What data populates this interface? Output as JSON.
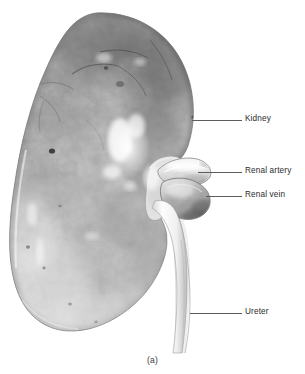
{
  "figure": {
    "caption": "(a)",
    "caption_x": 0,
    "caption_y": 355,
    "background_color": "#ffffff",
    "line_color": "#5c5c5c",
    "text_color": "#2b2b2b"
  },
  "labels": [
    {
      "id": "kidney",
      "text": "Kidney",
      "icon": "leader-line-icon",
      "line_x": 192,
      "line_y": 120,
      "line_length": 50,
      "label_x": 245,
      "label_y": 120
    },
    {
      "id": "renal-artery",
      "text": "Renal artery",
      "icon": "leader-line-icon",
      "line_x": 198,
      "line_y": 172,
      "line_length": 44,
      "label_x": 245,
      "label_y": 172
    },
    {
      "id": "renal-vein",
      "text": "Renal vein",
      "icon": "leader-line-icon",
      "line_x": 206,
      "line_y": 196,
      "line_length": 36,
      "label_x": 245,
      "label_y": 196
    },
    {
      "id": "ureter",
      "text": "Ureter",
      "icon": "leader-line-icon",
      "line_x": 190,
      "line_y": 313,
      "line_length": 52,
      "label_x": 245,
      "label_y": 313
    }
  ],
  "anatomy": {
    "kidney_bounds": {
      "x": 10,
      "y": 12,
      "width": 190,
      "height": 320
    },
    "hilum": {
      "x": 150,
      "y": 155,
      "width": 60,
      "height": 70
    },
    "ureter_path": {
      "top_x": 168,
      "top_y": 225,
      "bottom_x": 182,
      "bottom_y": 352
    },
    "highlight": {
      "x": 112,
      "y": 125,
      "width": 32,
      "height": 48
    }
  }
}
